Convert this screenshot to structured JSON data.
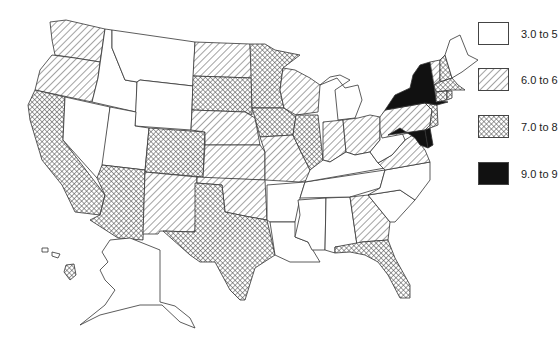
{
  "map": {
    "title": "",
    "legend": [
      {
        "id": "c1",
        "label": "3.0 to 5",
        "pattern": "none",
        "color": "#ffffff"
      },
      {
        "id": "c2",
        "label": "6.0 to 6",
        "pattern": "diagonal",
        "color": "#ffffff"
      },
      {
        "id": "c3",
        "label": "7.0 to 8",
        "pattern": "crosshatch",
        "color": "#ffffff"
      },
      {
        "id": "c4",
        "label": "9.0 to 9",
        "pattern": "solid",
        "color": "#111111"
      }
    ],
    "states": {
      "c1": [
        "ID",
        "MT",
        "WY",
        "NV",
        "UT",
        "MI",
        "KY",
        "WV",
        "TN",
        "AR",
        "LA",
        "MS",
        "AL",
        "SC",
        "NC",
        "ME",
        "AK"
      ],
      "c2": [
        "WA",
        "OR",
        "ND",
        "NE",
        "KS",
        "OK",
        "NM",
        "WI",
        "MO",
        "IN",
        "OH",
        "PA",
        "VA",
        "GA",
        "VT"
      ],
      "c3": [
        "CA",
        "AZ",
        "CO",
        "TX",
        "SD",
        "MN",
        "IA",
        "IL",
        "FL",
        "NH",
        "MA",
        "CT",
        "RI",
        "NJ",
        "HI"
      ],
      "c4": [
        "NY",
        "MD",
        "DE"
      ]
    }
  }
}
